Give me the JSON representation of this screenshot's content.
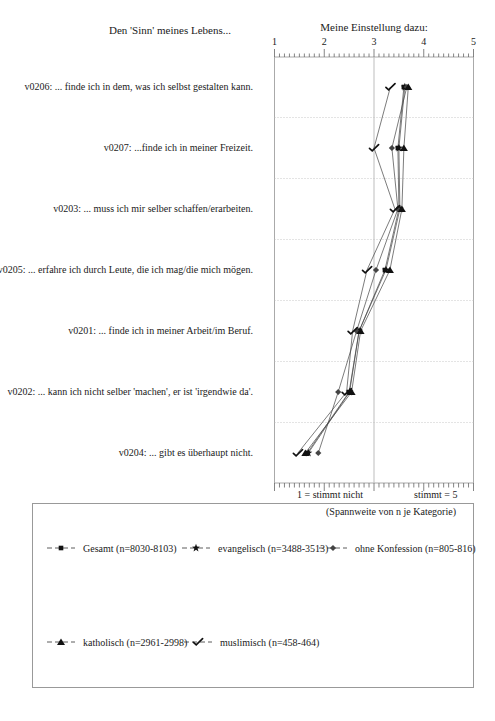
{
  "chart_data": {
    "type": "line",
    "header_left": "Den 'Sinn' meines Lebens...",
    "header_right": "Meine Einstellung dazu:",
    "x_tick_labels": [
      "1",
      "2",
      "3",
      "4",
      "5"
    ],
    "xlim": [
      1,
      5
    ],
    "minor_tick_step": 0.1,
    "grid": {
      "vertical_gridline_at": 3,
      "dotted_row_separators": true
    },
    "categories": [
      "v0206: ... finde ich in dem, was ich selbst gestalten kann.",
      "v0207: ...finde ich in meiner Freizeit.",
      "v0203: ... muss ich mir selber schaffen/erarbeiten.",
      "v0205: ... erfahre ich durch Leute, die ich mag/die mich mögen.",
      "v0201: ... finde ich in meiner Arbeit/im Beruf.",
      "v0202: ... kann ich nicht selber 'machen', er ist 'irgendwie da'.",
      "v0204: ... gibt es überhaupt nicht."
    ],
    "series": [
      {
        "name": "Gesamt (n=8030-8103)",
        "marker": "square",
        "color": "#111111",
        "values": [
          3.6,
          3.48,
          3.5,
          3.22,
          2.7,
          2.5,
          1.66
        ]
      },
      {
        "name": "evangelisch (n=3488-3513)",
        "marker": "star",
        "color": "#111111",
        "values": [
          3.62,
          3.5,
          3.52,
          3.24,
          2.7,
          2.51,
          1.68
        ]
      },
      {
        "name": "ohne Konfession (n=805-816)",
        "marker": "diamond",
        "color": "#444444",
        "values": [
          3.66,
          3.36,
          3.48,
          3.04,
          2.65,
          2.28,
          1.88
        ]
      },
      {
        "name": "katholisch (n=2961-2998)",
        "marker": "triangle",
        "color": "#111111",
        "values": [
          3.69,
          3.6,
          3.56,
          3.32,
          2.73,
          2.55,
          1.62
        ]
      },
      {
        "name": "muslimisch (n=458-464)",
        "marker": "check",
        "color": "#111111",
        "values": [
          3.33,
          3.0,
          3.42,
          2.86,
          2.57,
          2.45,
          1.47
        ]
      }
    ],
    "axis_footer_left": "1 = stimmt nicht",
    "axis_footer_right": "stimmt = 5",
    "legend_note": "(Spannweite von n je Kategorie)"
  }
}
